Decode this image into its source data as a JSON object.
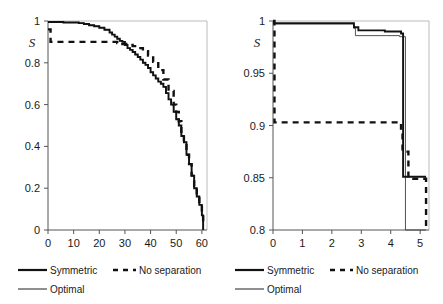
{
  "figure": {
    "panel_count": 2
  },
  "legend": {
    "items": [
      {
        "label": "Symmetric",
        "style": "solid-thick",
        "color": "#111111"
      },
      {
        "label": "No separation",
        "style": "dashed",
        "color": "#111111"
      },
      {
        "label": "Optimal",
        "style": "solid-thin",
        "color": "#333333"
      }
    ]
  },
  "chart_data": [
    {
      "type": "line",
      "panel": "left",
      "title": "",
      "xlabel": "",
      "ylabel": "S",
      "xlim": [
        0,
        62
      ],
      "ylim": [
        0,
        1
      ],
      "xticks": [
        "0",
        "10",
        "20",
        "30",
        "40",
        "50",
        "60"
      ],
      "xtick_values": [
        0,
        10,
        20,
        30,
        40,
        50,
        60
      ],
      "yticks": [
        "0",
        "0.2",
        "0.4",
        "0.6",
        "0.8",
        "1"
      ],
      "ytick_values": [
        0,
        0.2,
        0.4,
        0.6,
        0.8,
        1
      ],
      "grid": false,
      "legend_position": "below",
      "series": [
        {
          "name": "Symmetric",
          "style": "solid-thick",
          "step": true,
          "x": [
            0,
            3,
            6,
            9,
            12,
            14,
            16,
            18,
            20,
            22,
            24,
            25,
            26,
            27,
            28,
            29,
            30,
            31,
            32,
            33,
            34,
            35,
            36,
            37,
            38,
            39,
            40,
            41,
            42,
            43,
            44,
            45,
            46,
            47,
            48,
            49,
            50,
            51,
            52,
            53,
            54,
            55,
            56,
            57,
            58,
            59,
            60,
            60.5
          ],
          "y": [
            0.995,
            0.995,
            0.993,
            0.993,
            0.99,
            0.986,
            0.98,
            0.975,
            0.968,
            0.958,
            0.945,
            0.935,
            0.925,
            0.915,
            0.905,
            0.9,
            0.885,
            0.87,
            0.862,
            0.852,
            0.84,
            0.828,
            0.815,
            0.8,
            0.79,
            0.775,
            0.755,
            0.74,
            0.725,
            0.71,
            0.7,
            0.685,
            0.655,
            0.625,
            0.6,
            0.565,
            0.53,
            0.5,
            0.45,
            0.42,
            0.36,
            0.315,
            0.26,
            0.2,
            0.16,
            0.12,
            0.07,
            0.0
          ]
        },
        {
          "name": "Optimal",
          "style": "solid-thin",
          "step": true,
          "x": [
            0,
            3,
            6,
            9,
            12,
            14,
            16,
            18,
            20,
            22,
            24,
            25,
            26,
            27,
            28,
            29,
            30,
            31,
            32,
            33,
            34,
            35,
            36,
            37,
            38,
            39,
            40,
            41,
            42,
            43,
            44,
            45,
            46,
            47,
            48,
            49,
            50,
            51,
            52,
            53,
            54,
            55,
            56,
            57,
            58,
            59,
            60,
            60.5
          ],
          "y": [
            0.995,
            0.995,
            0.993,
            0.993,
            0.99,
            0.986,
            0.98,
            0.975,
            0.968,
            0.958,
            0.945,
            0.935,
            0.925,
            0.915,
            0.905,
            0.9,
            0.885,
            0.87,
            0.862,
            0.852,
            0.84,
            0.828,
            0.815,
            0.8,
            0.79,
            0.775,
            0.755,
            0.74,
            0.725,
            0.71,
            0.7,
            0.685,
            0.655,
            0.625,
            0.6,
            0.565,
            0.53,
            0.5,
            0.45,
            0.42,
            0.36,
            0.315,
            0.26,
            0.2,
            0.16,
            0.12,
            0.07,
            0.0
          ]
        },
        {
          "name": "No separation",
          "style": "dashed",
          "step": true,
          "x": [
            0,
            1,
            25,
            27,
            29,
            31,
            33,
            35,
            37,
            39,
            41,
            43,
            45,
            47,
            49,
            50,
            51,
            52,
            53,
            54,
            55,
            56,
            57,
            58,
            59,
            60,
            60.5
          ],
          "y": [
            0.96,
            0.9,
            0.9,
            0.895,
            0.89,
            0.885,
            0.88,
            0.87,
            0.855,
            0.835,
            0.805,
            0.765,
            0.72,
            0.665,
            0.6,
            0.565,
            0.52,
            0.47,
            0.42,
            0.36,
            0.315,
            0.26,
            0.21,
            0.165,
            0.125,
            0.075,
            0.02
          ]
        }
      ]
    },
    {
      "type": "line",
      "panel": "right",
      "title": "",
      "xlabel": "",
      "ylabel": "S",
      "xlim": [
        0,
        5.3
      ],
      "ylim": [
        0.8,
        1
      ],
      "xticks": [
        "0",
        "1",
        "2",
        "3",
        "4",
        "5"
      ],
      "xtick_values": [
        0,
        1,
        2,
        3,
        4,
        5
      ],
      "yticks": [
        "0.8",
        "0.85",
        "0.9",
        "0.95",
        "1"
      ],
      "ytick_values": [
        0.8,
        0.85,
        0.9,
        0.95,
        1
      ],
      "grid": false,
      "legend_position": "below",
      "series": [
        {
          "name": "Symmetric",
          "style": "solid-thick",
          "step": true,
          "x": [
            0,
            2.5,
            2.75,
            2.9,
            3.8,
            4.35,
            4.4,
            4.42,
            4.55,
            5.2
          ],
          "y": [
            0.998,
            0.998,
            0.994,
            0.991,
            0.99,
            0.988,
            0.988,
            0.851,
            0.851,
            0.851
          ]
        },
        {
          "name": "Optimal",
          "style": "solid-thin",
          "step": true,
          "x": [
            0,
            2.5,
            2.75,
            2.8,
            3.85,
            4.3,
            4.42,
            4.5,
            4.55,
            5.2
          ],
          "y": [
            0.997,
            0.997,
            0.993,
            0.986,
            0.986,
            0.985,
            0.985,
            0.8,
            0.8,
            0.8
          ]
        },
        {
          "name": "No separation",
          "style": "dashed",
          "step": true,
          "x": [
            0,
            0.05,
            0.2,
            4.3,
            4.35,
            4.4,
            4.45,
            4.6,
            5.15,
            5.2
          ],
          "y": [
            1.0,
            0.903,
            0.903,
            0.903,
            0.897,
            0.875,
            0.875,
            0.849,
            0.849,
            0.8
          ]
        }
      ]
    }
  ]
}
